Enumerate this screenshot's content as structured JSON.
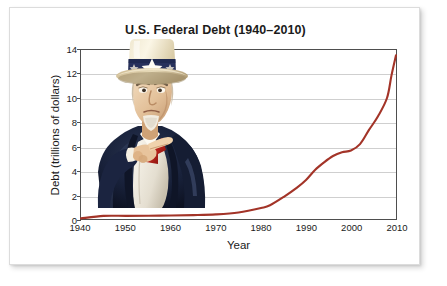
{
  "figure": {
    "title": "U.S. Federal Debt (1940–2010)",
    "illustration_name": "uncle-sam-i-want-you-illustration",
    "line_color": "#a33428",
    "grid_color": "#cfcfcf",
    "axis_color": "#4e4e4e",
    "background": "#ffffff"
  },
  "chart_data": {
    "type": "line",
    "title": "U.S. Federal Debt (1940–2010)",
    "subtitle": "",
    "xlabel": "Year",
    "ylabel": "Debt (trillions of dollars)",
    "xlim": [
      1940,
      2010
    ],
    "ylim": [
      0,
      14
    ],
    "xticks": [
      1940,
      1950,
      1960,
      1970,
      1980,
      1990,
      2000,
      2010
    ],
    "xtick_labels": [
      "1940",
      "1950",
      "1960",
      "1970",
      "1980",
      "1990",
      "2000",
      "2010"
    ],
    "yticks": [
      0,
      2,
      4,
      6,
      8,
      10,
      12,
      14
    ],
    "ytick_labels": [
      "0",
      "2",
      "4",
      "6",
      "8",
      "10",
      "12",
      "14"
    ],
    "grid": "horizontal",
    "legend": "none",
    "annotations": [],
    "series": [
      {
        "name": "U.S. Federal Debt",
        "color": "#a33428",
        "x": [
          1940,
          1945,
          1950,
          1955,
          1960,
          1965,
          1970,
          1975,
          1980,
          1982,
          1985,
          1988,
          1990,
          1992,
          1994,
          1996,
          1998,
          2000,
          2002,
          2004,
          2006,
          2008,
          2009,
          2010
        ],
        "values": [
          0.05,
          0.26,
          0.26,
          0.27,
          0.29,
          0.32,
          0.38,
          0.54,
          0.91,
          1.14,
          1.82,
          2.6,
          3.23,
          4.06,
          4.69,
          5.22,
          5.53,
          5.67,
          6.2,
          7.38,
          8.51,
          10.02,
          11.9,
          13.56
        ]
      }
    ]
  },
  "axes": {
    "y_tick_labels": [
      "14",
      "12",
      "10",
      "8",
      "6",
      "4",
      "2",
      "0"
    ],
    "x_tick_labels": [
      "1940",
      "1950",
      "1960",
      "1970",
      "1980",
      "1990",
      "2000",
      "2010"
    ],
    "y_axis_title": "Debt (trillions of dollars)",
    "x_axis_title": "Year"
  }
}
